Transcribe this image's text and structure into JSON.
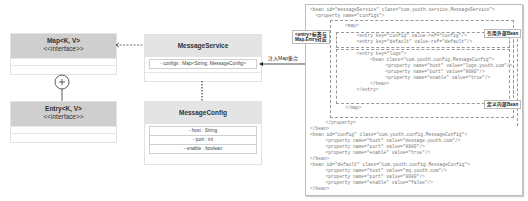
{
  "classes": {
    "map": {
      "name": "Map<K, V>",
      "stereotype": "<<interface>>"
    },
    "entry": {
      "name": "Entry<K, V>",
      "stereotype": "<<interface>>"
    },
    "message_service": {
      "name": "MessageService",
      "attributes": [
        "- configs : Map<String, MessageConfig>"
      ]
    },
    "message_config": {
      "name": "MessageConfig",
      "attributes": [
        "- host : String",
        "- port : int",
        "- enable : boolean"
      ]
    }
  },
  "annotations": {
    "inject_map": "注入Map集合",
    "entry_label_line1": "<entry>标签与",
    "entry_label_line2": "Map.Entry对应",
    "ref_external": "引用外部Bean",
    "define_inner": "定义内部Bean"
  },
  "code_lines": [
    "<bean id=\"messageService\" class=\"com.youth.service.MessageService\">",
    "  <property name=\"configs\">",
    "    <map>",
    "      <entry key=\"config\" value-ref=\"config\"/>",
    "      <entry key=\"default\" value-ref=\"default\"/>",
    "      <entry key=\"logs\">",
    "        <bean class=\"com.youth.config.MessageConfig\">",
    "          <property name=\"host\" value=\"logs.youth.com\"/>",
    "          <property name=\"port\" value=\"8080\"/>",
    "          <property name=\"enable\" value=\"true\"/>",
    "        </bean>",
    "      </entry>",
    "    </map>",
    "  </property>",
    "</bean>",
    "<bean id=\"config\" class=\"com.youth.config.MessageConfig\">",
    "  <property name=\"host\" value=\"message.youth.com\"/>",
    "  <property name=\"port\" value=\"8080\"/>",
    "  <property name=\"enable\" value=\"true\"/>",
    "</bean>",
    "<bean id=\"default\" class=\"com.youth.config.MessageConfig\">",
    "  <property name=\"host\" value=\"mq.youth.com\"/>",
    "  <property name=\"port\" value=\"8080\"/>",
    "  <property name=\"enable\" value=\"false\"/>",
    "</bean>"
  ]
}
